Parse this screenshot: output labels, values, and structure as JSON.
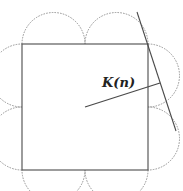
{
  "diagram": {
    "label": "K(n)",
    "label_pos": {
      "x": 102,
      "y": 76
    },
    "colors": {
      "stroke": "#555555",
      "dashed": "#888888",
      "text": "#222222"
    },
    "square": {
      "x1": 22,
      "y1": 44,
      "x2": 148,
      "y2": 170
    },
    "arc_radius": 31.5,
    "center": {
      "x": 85,
      "y": 107
    },
    "radius_line_end": {
      "x": 160,
      "y": 83
    },
    "tangent_line": {
      "x1": 137,
      "y1": 12,
      "x2": 176,
      "y2": 131
    }
  }
}
